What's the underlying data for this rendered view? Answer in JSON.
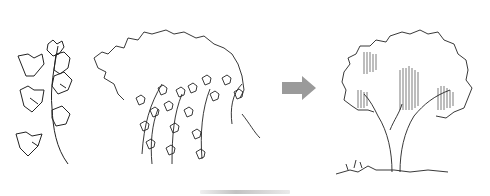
{
  "figure": {
    "panels": [
      {
        "id": "ivy-vine",
        "description": "Ivy vine sprig sketch"
      },
      {
        "id": "ivy-canopy",
        "description": "Ivy-draped canopy sketch"
      },
      {
        "id": "arrow",
        "description": "Gray right arrow"
      },
      {
        "id": "tree",
        "description": "Shaded deciduous tree sketch"
      }
    ],
    "colors": {
      "line": "#222222",
      "arrow": "#9a9a9a",
      "background": "#ffffff"
    }
  }
}
